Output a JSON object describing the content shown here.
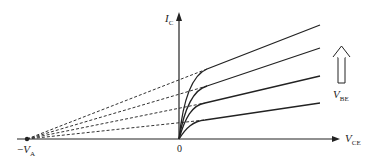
{
  "diagram": {
    "colors": {
      "line": "#222222",
      "dash": "#333333",
      "background": "#ffffff"
    },
    "axes": {
      "y_label": {
        "main": "I",
        "sub": "C"
      },
      "x_label": {
        "main": "V",
        "sub": "CE"
      },
      "origin_label": "0",
      "early_label": {
        "prefix": "−",
        "main": "V",
        "sub": "A"
      }
    },
    "arrow_annotation": {
      "main": "V",
      "sub": "BE",
      "meaning": "increasing"
    },
    "curves": [
      {
        "id": "vbe4",
        "knee": [
          207,
          69
        ],
        "end": [
          320,
          25
        ]
      },
      {
        "id": "vbe3",
        "knee": [
          207,
          86
        ],
        "end": [
          320,
          48
        ]
      },
      {
        "id": "vbe2",
        "knee": [
          205,
          103
        ],
        "end": [
          320,
          76
        ]
      },
      {
        "id": "vbe1",
        "knee": [
          205,
          120
        ],
        "end": [
          320,
          103
        ]
      }
    ],
    "early_point": [
      27,
      139
    ]
  }
}
